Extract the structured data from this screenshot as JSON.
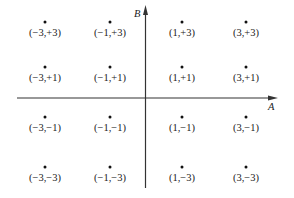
{
  "diagram": {
    "type": "constellation",
    "axes": {
      "horizontal_label": "A",
      "vertical_label": "B"
    },
    "points": [
      {
        "label": "(−3,+3)",
        "x": -3,
        "y": 3
      },
      {
        "label": "(−1,+3)",
        "x": -1,
        "y": 3
      },
      {
        "label": "(1,+3)",
        "x": 1,
        "y": 3
      },
      {
        "label": "(3,+3)",
        "x": 3,
        "y": 3
      },
      {
        "label": "(−3,+1)",
        "x": -3,
        "y": 1
      },
      {
        "label": "(−1,+1)",
        "x": -1,
        "y": 1
      },
      {
        "label": "(1,+1)",
        "x": 1,
        "y": 1
      },
      {
        "label": "(3,+1)",
        "x": 3,
        "y": 1
      },
      {
        "label": "(−3,−1)",
        "x": -3,
        "y": -1
      },
      {
        "label": "(−1,−1)",
        "x": -1,
        "y": -1
      },
      {
        "label": "(1,−1)",
        "x": 1,
        "y": -1
      },
      {
        "label": "(3,−1)",
        "x": 3,
        "y": -1
      },
      {
        "label": "(−3,−3)",
        "x": -3,
        "y": -3
      },
      {
        "label": "(−1,−3)",
        "x": -1,
        "y": -3
      },
      {
        "label": "(1,−3)",
        "x": 1,
        "y": -3
      },
      {
        "label": "(3,−3)",
        "x": 3,
        "y": -3
      }
    ]
  }
}
